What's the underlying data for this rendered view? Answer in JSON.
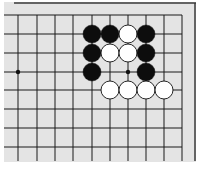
{
  "board": {
    "background": "#e4e4e4",
    "line_color": "#1a1a1a",
    "border_color": "#3a3a3a",
    "columns_x": [
      18,
      37,
      55,
      73,
      92,
      110,
      128,
      146,
      164,
      182
    ],
    "rows_y": [
      15,
      34,
      53,
      72,
      90,
      109,
      128,
      147
    ],
    "stone_radius": 9,
    "stones": [
      {
        "color": "black",
        "col": 4,
        "row": 1
      },
      {
        "color": "black",
        "col": 5,
        "row": 1
      },
      {
        "color": "white",
        "col": 6,
        "row": 1
      },
      {
        "color": "black",
        "col": 7,
        "row": 1
      },
      {
        "color": "black",
        "col": 4,
        "row": 2
      },
      {
        "color": "white",
        "col": 5,
        "row": 2
      },
      {
        "color": "white",
        "col": 6,
        "row": 2
      },
      {
        "color": "black",
        "col": 7,
        "row": 2
      },
      {
        "color": "black",
        "col": 4,
        "row": 3
      },
      {
        "color": "black",
        "col": 7,
        "row": 3
      },
      {
        "color": "white",
        "col": 5,
        "row": 4
      },
      {
        "color": "white",
        "col": 6,
        "row": 4
      },
      {
        "color": "white",
        "col": 7,
        "row": 4
      },
      {
        "color": "white",
        "col": 8,
        "row": 4
      }
    ],
    "star_points": [
      {
        "col": 0,
        "row": 3
      },
      {
        "col": 6,
        "row": 3
      }
    ]
  }
}
